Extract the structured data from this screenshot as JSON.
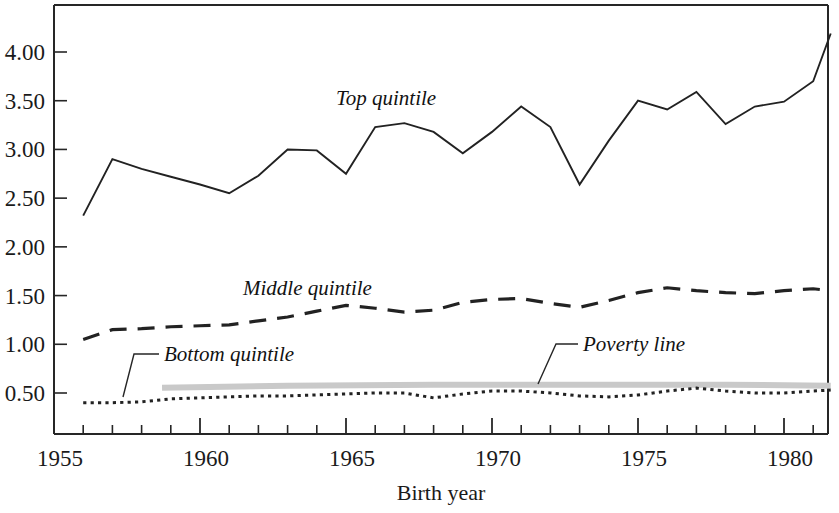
{
  "figure": {
    "background_color": "#ffffff",
    "axis_color": "#262626",
    "series_color": "#222222",
    "poverty_band_color": "#c9c9c9"
  },
  "axes": {
    "x_title": "Birth year",
    "y_title": "",
    "x_tick_labels": [
      "1955",
      "1960",
      "1965",
      "1970",
      "1975",
      "1980"
    ],
    "x_tick_values": [
      1955,
      1960,
      1965,
      1970,
      1975,
      1980
    ],
    "y_tick_labels": [
      "0.50",
      "1.00",
      "1.50",
      "2.00",
      "2.50",
      "3.00",
      "3.50",
      "4.00"
    ],
    "y_tick_values": [
      0.5,
      1.0,
      1.5,
      2.0,
      2.5,
      3.0,
      3.5,
      4.0
    ],
    "x_minor_step": 1,
    "x_range": [
      1955.0,
      1981.6
    ],
    "y_range": [
      0.2,
      4.45
    ]
  },
  "annotations": [
    {
      "name": "top-quintile-label",
      "text": "Top quintile",
      "x": 336,
      "y": 105,
      "has_leader": false
    },
    {
      "name": "middle-quintile-label",
      "text": "Middle quintile",
      "x": 243,
      "y": 295,
      "has_leader": false
    },
    {
      "name": "bottom-quintile-label",
      "text": "Bottom quintile",
      "x": 164,
      "y": 361,
      "has_leader": true,
      "leader_path": "M159,354 L134,354 L123,397"
    },
    {
      "name": "poverty-line-label",
      "text": "Poverty line",
      "x": 583,
      "y": 351,
      "has_leader": true,
      "leader_path": "M578,344 L556,344 L538,384"
    }
  ],
  "chart_data": {
    "type": "line",
    "title": "",
    "xlabel": "Birth year",
    "ylabel": "",
    "xlim": [
      1955.0,
      1981.6
    ],
    "ylim": [
      0.2,
      4.45
    ],
    "grid": false,
    "legend": "inline-annotations",
    "x": [
      1956,
      1957,
      1958,
      1959,
      1960,
      1961,
      1962,
      1963,
      1964,
      1965,
      1966,
      1967,
      1968,
      1969,
      1970,
      1971,
      1972,
      1973,
      1974,
      1975,
      1976,
      1977,
      1978,
      1979,
      1980,
      1981,
      1981.6
    ],
    "series": [
      {
        "name": "Top quintile",
        "style": "solid",
        "x": [
          1956,
          1957,
          1958,
          1959,
          1960,
          1961,
          1962,
          1963,
          1964,
          1965,
          1966,
          1967,
          1968,
          1969,
          1970,
          1971,
          1972,
          1973,
          1974,
          1975,
          1976,
          1977,
          1978,
          1979,
          1980,
          1981,
          1981.6
        ],
        "values": [
          2.32,
          2.9,
          2.8,
          2.72,
          2.64,
          2.55,
          2.73,
          3.0,
          2.99,
          2.75,
          3.23,
          3.27,
          3.18,
          2.96,
          3.18,
          3.44,
          3.23,
          2.64,
          3.09,
          3.5,
          3.41,
          3.59,
          3.26,
          3.44,
          3.49,
          3.7,
          4.19
        ]
      },
      {
        "name": "Middle quintile",
        "style": "dashed",
        "x": [
          1956,
          1957,
          1958,
          1959,
          1960,
          1961,
          1962,
          1963,
          1964,
          1965,
          1966,
          1967,
          1968,
          1969,
          1970,
          1971,
          1972,
          1973,
          1974,
          1975,
          1976,
          1977,
          1978,
          1979,
          1980,
          1981,
          1981.6
        ],
        "values": [
          1.05,
          1.15,
          1.16,
          1.18,
          1.19,
          1.2,
          1.24,
          1.28,
          1.34,
          1.4,
          1.37,
          1.33,
          1.35,
          1.43,
          1.46,
          1.47,
          1.42,
          1.38,
          1.45,
          1.53,
          1.58,
          1.55,
          1.53,
          1.52,
          1.55,
          1.57,
          1.55
        ]
      },
      {
        "name": "Bottom quintile",
        "style": "dotted",
        "x": [
          1956,
          1957,
          1958,
          1959,
          1960,
          1961,
          1962,
          1963,
          1964,
          1965,
          1966,
          1967,
          1968,
          1969,
          1970,
          1971,
          1972,
          1973,
          1974,
          1975,
          1976,
          1977,
          1978,
          1979,
          1980,
          1981,
          1981.6
        ],
        "values": [
          0.4,
          0.4,
          0.41,
          0.44,
          0.45,
          0.46,
          0.47,
          0.47,
          0.48,
          0.49,
          0.5,
          0.5,
          0.45,
          0.49,
          0.52,
          0.52,
          0.5,
          0.47,
          0.46,
          0.48,
          0.52,
          0.55,
          0.52,
          0.5,
          0.5,
          0.52,
          0.53
        ]
      },
      {
        "name": "Poverty line",
        "style": "gray-band",
        "x": [
          1958.7,
          1963,
          1968,
          1973,
          1978,
          1981.6
        ],
        "values": [
          0.555,
          0.575,
          0.585,
          0.585,
          0.585,
          0.575
        ]
      }
    ]
  }
}
